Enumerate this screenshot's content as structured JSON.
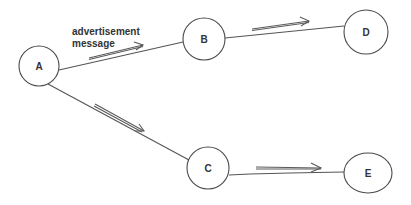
{
  "diagram": {
    "type": "directed-graph",
    "background": "#ffffff",
    "stroke_color": "#555555",
    "nodes": [
      {
        "id": "A",
        "label": "A",
        "cx": 39,
        "cy": 66,
        "rx": 20,
        "ry": 20
      },
      {
        "id": "B",
        "label": "B",
        "cx": 204,
        "cy": 39,
        "rx": 21,
        "ry": 21
      },
      {
        "id": "C",
        "label": "C",
        "cx": 208,
        "cy": 168,
        "rx": 21,
        "ry": 21
      },
      {
        "id": "D",
        "label": "D",
        "cx": 366,
        "cy": 32,
        "rx": 22,
        "ry": 22
      },
      {
        "id": "E",
        "label": "E",
        "cx": 368,
        "cy": 173,
        "rx": 24,
        "ry": 20
      }
    ],
    "edges": [
      {
        "from": "A",
        "to": "B",
        "label": "advertisement message"
      },
      {
        "from": "A",
        "to": "C",
        "label": ""
      },
      {
        "from": "B",
        "to": "D",
        "label": ""
      },
      {
        "from": "C",
        "to": "E",
        "label": ""
      }
    ],
    "edge_label": {
      "line1": "advertisement",
      "line2": "message"
    }
  }
}
